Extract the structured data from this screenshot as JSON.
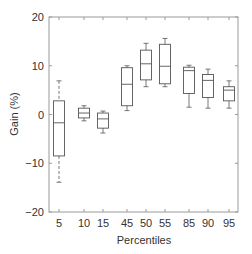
{
  "chart_data": {
    "type": "box",
    "title": "",
    "xlabel": "Percentiles",
    "ylabel": "Gain (%)",
    "ylim": [
      -20,
      20
    ],
    "yticks": [
      -20,
      -10,
      0,
      10,
      20
    ],
    "grid": false,
    "categories": [
      "5",
      "10",
      "15",
      "45",
      "50",
      "55",
      "85",
      "90",
      "95"
    ],
    "boxes": [
      {
        "category": "5",
        "whisker_low": -13.9,
        "q1": -8.5,
        "median": -1.7,
        "q3": 2.8,
        "whisker_high": 6.9
      },
      {
        "category": "10",
        "whisker_low": -1.3,
        "q1": -0.7,
        "median": 0.3,
        "q3": 1.3,
        "whisker_high": 1.8
      },
      {
        "category": "15",
        "whisker_low": -3.8,
        "q1": -2.8,
        "median": -0.9,
        "q3": 0.3,
        "whisker_high": 0.7
      },
      {
        "category": "45",
        "whisker_low": 0.8,
        "q1": 1.8,
        "median": 6.2,
        "q3": 9.6,
        "whisker_high": 10.0
      },
      {
        "category": "50",
        "whisker_low": 5.7,
        "q1": 7.1,
        "median": 10.4,
        "q3": 13.2,
        "whisker_high": 14.6
      },
      {
        "category": "55",
        "whisker_low": 5.7,
        "q1": 6.3,
        "median": 9.9,
        "q3": 14.4,
        "whisker_high": 15.6
      },
      {
        "category": "85",
        "whisker_low": 1.5,
        "q1": 4.3,
        "median": 9.0,
        "q3": 9.7,
        "whisker_high": 10.1
      },
      {
        "category": "90",
        "whisker_low": 1.3,
        "q1": 3.5,
        "median": 7.0,
        "q3": 8.2,
        "whisker_high": 9.3
      },
      {
        "category": "95",
        "whisker_low": 1.3,
        "q1": 2.8,
        "median": 5.0,
        "q3": 5.7,
        "whisker_high": 6.9
      }
    ],
    "x_positions_px": [
      59,
      84,
      103,
      127,
      146,
      165,
      189,
      208,
      229
    ]
  },
  "colors": {
    "axis": "#9a9a9a",
    "box": "#555555",
    "text": "#333333"
  }
}
